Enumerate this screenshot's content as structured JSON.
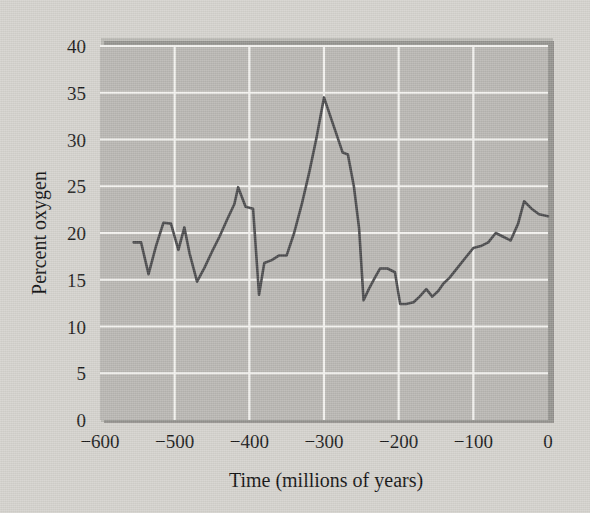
{
  "figure": {
    "background_color": "#d4d2cd",
    "plot_background_color": "#b8b6b2",
    "grid_color": "#f2f1ee",
    "line_color": "#4a4a4c",
    "shadow_color": "#7d7b78",
    "text_color": "#1a1a1a"
  },
  "chart_data": {
    "type": "line",
    "title": "",
    "subtitle": "",
    "xlabel": "Time (millions of years)",
    "ylabel": "Percent oxygen",
    "xlim": [
      -600,
      0
    ],
    "ylim": [
      0,
      40
    ],
    "grid": true,
    "legend": false,
    "legend_position": "none",
    "xticks": [
      -600,
      -500,
      -400,
      -300,
      -200,
      -100,
      0
    ],
    "xtick_labels": [
      "−600",
      "−500",
      "−400",
      "−300",
      "−200",
      "−100",
      "0"
    ],
    "yticks": [
      0,
      5,
      10,
      15,
      20,
      25,
      30,
      35,
      40
    ],
    "ytick_labels": [
      "0",
      "5",
      "10",
      "15",
      "20",
      "25",
      "30",
      "35",
      "40"
    ],
    "series": [
      {
        "name": "Atmospheric oxygen",
        "color": "#4a4a4c",
        "x": [
          -555,
          -545,
          -535,
          -525,
          -515,
          -505,
          -495,
          -487,
          -480,
          -470,
          -460,
          -450,
          -440,
          -430,
          -420,
          -415,
          -405,
          -395,
          -387,
          -380,
          -370,
          -360,
          -350,
          -340,
          -330,
          -320,
          -310,
          -300,
          -292,
          -283,
          -275,
          -268,
          -260,
          -253,
          -247,
          -240,
          -232,
          -225,
          -215,
          -205,
          -198,
          -190,
          -180,
          -172,
          -163,
          -155,
          -147,
          -140,
          -132,
          -120,
          -110,
          -100,
          -90,
          -80,
          -70,
          -60,
          -50,
          -40,
          -32,
          -22,
          -12,
          0
        ],
        "y": [
          19.0,
          19.0,
          15.6,
          18.6,
          21.1,
          21.0,
          18.2,
          20.6,
          17.8,
          14.8,
          16.3,
          18.0,
          19.6,
          21.4,
          23.1,
          24.9,
          22.8,
          22.6,
          13.4,
          16.8,
          17.1,
          17.6,
          17.6,
          20.0,
          23.0,
          26.4,
          30.2,
          34.5,
          32.6,
          30.5,
          28.6,
          28.4,
          25.0,
          20.5,
          12.8,
          14.0,
          15.2,
          16.2,
          16.2,
          15.8,
          12.4,
          12.4,
          12.6,
          13.2,
          14.0,
          13.2,
          13.8,
          14.6,
          15.2,
          16.4,
          17.4,
          18.4,
          18.6,
          19.0,
          20.0,
          19.6,
          19.2,
          21.0,
          23.4,
          22.6,
          22.0,
          21.8
        ]
      }
    ]
  }
}
